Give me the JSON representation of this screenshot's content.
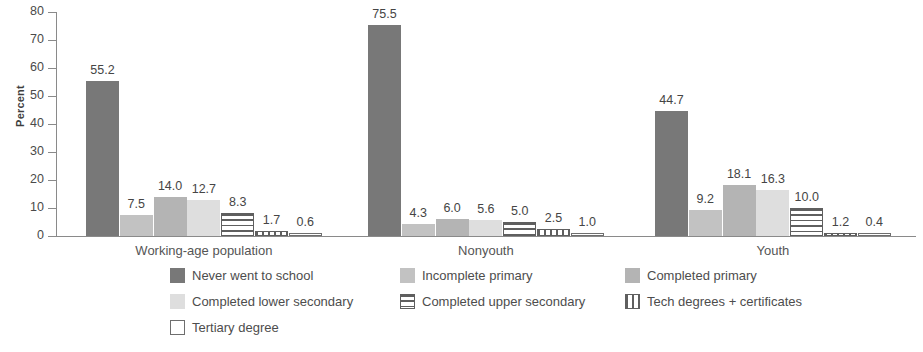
{
  "chart_data": {
    "type": "bar",
    "title": "",
    "subtitle": "",
    "xlabel": "",
    "ylabel": "Percent",
    "ylim": [
      0,
      80
    ],
    "yticks": [
      0,
      10,
      20,
      30,
      40,
      50,
      60,
      70,
      80
    ],
    "ytick_labels": [
      "0",
      "10",
      "20",
      "30",
      "40",
      "50",
      "60",
      "70",
      "80"
    ],
    "grid": false,
    "legend_position": "bottom",
    "categories": [
      "Working-age population",
      "Nonyouth",
      "Youth"
    ],
    "series": [
      {
        "name": "Never went to school",
        "fill": "solid-dark",
        "color": "#787878",
        "values": [
          55.2,
          75.5,
          44.7
        ],
        "labels": [
          "55.2",
          "75.5",
          "44.7"
        ]
      },
      {
        "name": "Incomplete primary",
        "fill": "gray-mid",
        "color": "#c2c2c2",
        "values": [
          7.5,
          4.3,
          9.2
        ],
        "labels": [
          "7.5",
          "4.3",
          "9.2"
        ]
      },
      {
        "name": "Completed primary",
        "fill": "gray-med2",
        "color": "#b4b4b4",
        "values": [
          14.0,
          6.0,
          18.1
        ],
        "labels": [
          "14.0",
          "6.0",
          "18.1"
        ]
      },
      {
        "name": "Completed lower secondary",
        "fill": "gray-light",
        "color": "#dedede",
        "values": [
          12.7,
          5.6,
          16.3
        ],
        "labels": [
          "12.7",
          "5.6",
          "16.3"
        ]
      },
      {
        "name": "Completed upper secondary",
        "fill": "hstripe",
        "color": "#5f5f5f",
        "values": [
          8.3,
          5.0,
          10.0
        ],
        "labels": [
          "8.3",
          "5.0",
          "10.0"
        ]
      },
      {
        "name": "Tech degrees + certificates",
        "fill": "vstripe",
        "color": "#5f5f5f",
        "values": [
          1.7,
          2.5,
          1.2
        ],
        "labels": [
          "1.7",
          "2.5",
          "1.2"
        ]
      },
      {
        "name": "Tertiary degree",
        "fill": "white",
        "color": "#ffffff",
        "values": [
          0.6,
          1.0,
          0.4
        ],
        "labels": [
          "0.6",
          "1.0",
          "0.4"
        ]
      }
    ]
  },
  "axis": {
    "y_label": "Percent"
  },
  "legend": {
    "items": [
      "Never went to school",
      "Incomplete primary",
      "Completed primary",
      "Completed lower secondary",
      "Completed upper secondary",
      "Tech degrees + certificates",
      "Tertiary degree"
    ]
  }
}
